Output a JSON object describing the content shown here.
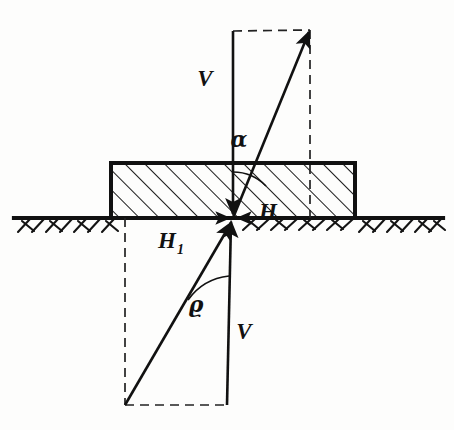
{
  "figure": {
    "kind": "engineering-statics-diagram",
    "canvas": {
      "width": 454,
      "height": 430
    },
    "colors": {
      "ink": "#111111",
      "paper": "#fdfdfc",
      "hatch": "#1a1a1a",
      "dashed": "#222222"
    }
  },
  "labels": {
    "upper_vertical": "V",
    "lower_vertical": "V",
    "horizontal": "H",
    "horizontal_one_base": "H",
    "horizontal_one_sub": "1",
    "angle_alpha": "α",
    "angle_rho": "ϱ"
  },
  "geometry": {
    "ground_line": {
      "x1": 14,
      "y1": 218,
      "x2": 443,
      "y2": 218
    },
    "block": {
      "x": 111,
      "y": 163,
      "width": 244,
      "height": 55
    },
    "origin": {
      "x": 233,
      "y": 218
    },
    "upper_parallelogram": {
      "apex": {
        "x": 310,
        "y": 30
      },
      "vertical_top": {
        "x": 233,
        "y": 31
      },
      "dashed_top": {
        "x1": 233,
        "y1": 31,
        "x2": 310,
        "y2": 30
      },
      "dashed_right": {
        "x1": 310,
        "y1": 30,
        "x2": 310,
        "y2": 218
      }
    },
    "lower_parallelogram": {
      "tail": {
        "x": 125,
        "y": 405
      },
      "vertical_bottom": {
        "x": 227,
        "y": 405
      },
      "dashed_bottom": {
        "x1": 125,
        "y1": 405,
        "x2": 227,
        "y2": 405
      },
      "dashed_left": {
        "x1": 125,
        "y1": 218,
        "x2": 125,
        "y2": 405
      }
    },
    "angle_arc_alpha": {
      "radius": 46,
      "from_deg": 270,
      "to_deg": 315
    },
    "angle_arc_rho": {
      "radius": 58,
      "from_deg": 90,
      "to_deg": 133
    }
  },
  "label_positions": {
    "upper_vertical": {
      "x": 205,
      "y": 86
    },
    "alpha": {
      "x": 239,
      "y": 147
    },
    "horizontal": {
      "x": 268,
      "y": 219
    },
    "horizontal_one": {
      "x": 158,
      "y": 248
    },
    "rho": {
      "x": 196,
      "y": 312
    },
    "lower_vertical": {
      "x": 244,
      "y": 339
    }
  }
}
